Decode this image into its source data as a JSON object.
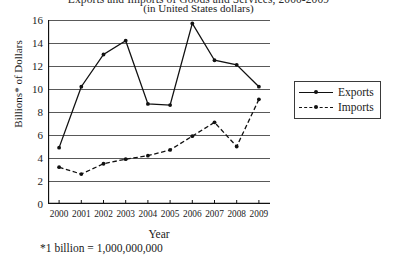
{
  "chart_data": {
    "type": "line",
    "title": "Exports and Imports of Goods and Services, 2000-2009",
    "subtitle": "(in United States dollars)",
    "xlabel": "Year",
    "ylabel": "Billions* of Dollars",
    "footnote": "*1 billion = 1,000,000,000",
    "categories": [
      "2000",
      "2001",
      "2002",
      "2003",
      "2004",
      "2005",
      "2006",
      "2007",
      "2008",
      "2009"
    ],
    "ylim": [
      0,
      16
    ],
    "yticks": [
      0,
      2,
      4,
      6,
      8,
      10,
      12,
      14,
      16
    ],
    "grid": true,
    "legend_position": "right",
    "series": [
      {
        "name": "Exports",
        "style": "solid",
        "values": [
          4.9,
          10.2,
          13.0,
          14.2,
          8.7,
          8.6,
          15.7,
          12.5,
          12.1,
          10.2
        ]
      },
      {
        "name": "Imports",
        "style": "dashed",
        "values": [
          3.2,
          2.6,
          3.5,
          3.9,
          4.2,
          4.7,
          5.9,
          7.1,
          5.0,
          9.1
        ]
      }
    ]
  }
}
